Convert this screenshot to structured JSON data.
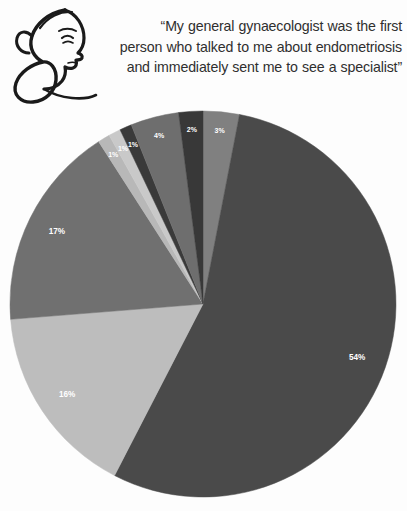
{
  "header": {
    "logo_name": "woman-profile-line-art-logo",
    "quote_lines": [
      "“My general gynaecologist was the first",
      "person who talked to me about endometriosis",
      "and immediately sent me to see a specialist”"
    ],
    "quote_full": "“My general gynaecologist was the first person who talked to me about endometriosis and immediately sent me to see a specialist”"
  },
  "chart_data": {
    "type": "pie",
    "title": "",
    "xlabel": "",
    "ylabel": "",
    "legend": "none",
    "start_angle_deg": 0,
    "direction": "clockwise",
    "total_label": "99%",
    "categories": [
      "Slice 1",
      "Slice 2",
      "Slice 3",
      "Slice 4",
      "Slice 5",
      "Slice 6",
      "Slice 7",
      "Slice 8",
      "Slice 9"
    ],
    "values": [
      3,
      54,
      16,
      17,
      1,
      1,
      1,
      4,
      2
    ],
    "labels": [
      "3%",
      "54%",
      "16%",
      "17%",
      "1%",
      "1%",
      "1%",
      "4%",
      "2%"
    ],
    "colors": [
      "#808080",
      "#4a4a4a",
      "#bdbdbd",
      "#707070",
      "#b8b8b8",
      "#c9c9c9",
      "#3a3a3a",
      "#6e6e6e",
      "#383838"
    ],
    "slices": [
      {
        "label": "3%",
        "value": 3,
        "color": "#808080"
      },
      {
        "label": "54%",
        "value": 54,
        "color": "#4a4a4a"
      },
      {
        "label": "16%",
        "value": 16,
        "color": "#bdbdbd"
      },
      {
        "label": "17%",
        "value": 17,
        "color": "#707070"
      },
      {
        "label": "1%",
        "value": 1,
        "color": "#b8b8b8"
      },
      {
        "label": "1%",
        "value": 1,
        "color": "#c9c9c9"
      },
      {
        "label": "1%",
        "value": 1,
        "color": "#3a3a3a"
      },
      {
        "label": "4%",
        "value": 4,
        "color": "#6e6e6e"
      },
      {
        "label": "2%",
        "value": 2,
        "color": "#383838"
      }
    ]
  },
  "theme": {
    "background": "#fdfdfd",
    "text_color": "#2f2f2f",
    "label_color": "#ffffff",
    "logo_color": "#1a1a1a"
  }
}
